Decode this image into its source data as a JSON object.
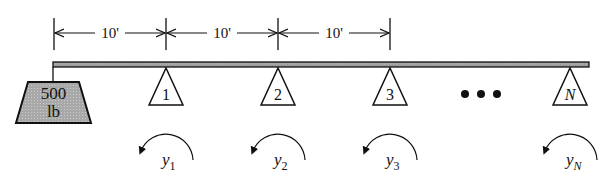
{
  "diagram": {
    "colors": {
      "stroke": "#111111",
      "beam_fill": "#9a9a9a",
      "weight_fill": "#a8a8a8",
      "background": "#ffffff"
    },
    "dimensions": [
      {
        "label": "10'",
        "x1": 54,
        "x2": 166
      },
      {
        "label": "10'",
        "x1": 166,
        "x2": 278
      },
      {
        "label": "10'",
        "x1": 278,
        "x2": 390
      }
    ],
    "dimension_line_y": 33,
    "beam": {
      "x1": 53,
      "x2": 589,
      "y_top": 62,
      "y_bottom": 67
    },
    "weight": {
      "line1": "500",
      "line2": "lb",
      "hanger_x": 53,
      "top_y": 82,
      "bottom_y": 123,
      "top_x1": 28,
      "top_x2": 79,
      "bottom_x1": 16,
      "bottom_x2": 91
    },
    "supports": [
      {
        "label": "1",
        "x": 166,
        "italic": false
      },
      {
        "label": "2",
        "x": 278,
        "italic": false
      },
      {
        "label": "3",
        "x": 390,
        "italic": false
      },
      {
        "label": "N",
        "x": 570,
        "italic": true
      }
    ],
    "ellipsis": {
      "symbol": "•••",
      "dots_x": [
        465,
        481,
        497
      ],
      "y": 94
    },
    "rotations": [
      {
        "symbol": "y",
        "subscript": "1",
        "cx": 166
      },
      {
        "symbol": "y",
        "subscript": "2",
        "cx": 278
      },
      {
        "symbol": "y",
        "subscript": "3",
        "cx": 390
      },
      {
        "symbol": "y",
        "subscript": "N",
        "cx": 570
      }
    ]
  }
}
